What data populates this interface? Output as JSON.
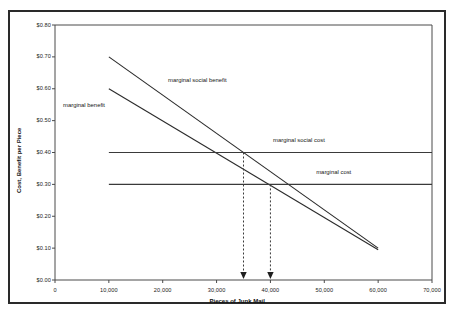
{
  "chart_data": {
    "type": "line",
    "title": "",
    "xlabel": "Pieces of Junk Mail",
    "ylabel": "Cost, Benefit per Piece",
    "xlim": [
      0,
      70000
    ],
    "ylim": [
      0.0,
      0.8
    ],
    "grid": false,
    "legend_position": "inline-labels",
    "x_ticks": [
      0,
      10000,
      20000,
      30000,
      40000,
      50000,
      60000,
      70000
    ],
    "x_tick_labels": [
      "0",
      "10,000",
      "20,000",
      "30,000",
      "40,000",
      "50,000",
      "60,000",
      "70,000"
    ],
    "y_ticks": [
      0.0,
      0.1,
      0.2,
      0.3,
      0.4,
      0.5,
      0.6,
      0.7,
      0.8
    ],
    "y_tick_labels": [
      "$0.00",
      "$0.10",
      "$0.20",
      "$0.30",
      "$0.40",
      "$0.50",
      "$0.60",
      "$0.70",
      "$0.80"
    ],
    "series": [
      {
        "name": "marginal social benefit",
        "label": "marginal social benefit",
        "type": "line",
        "x": [
          10000,
          60000
        ],
        "values": [
          0.7,
          0.1
        ],
        "label_x": 21000,
        "label_y": 0.625
      },
      {
        "name": "marginal benefit",
        "label": "marginal benefit",
        "type": "line",
        "x": [
          10000,
          60000
        ],
        "values": [
          0.6,
          0.095
        ],
        "label_x": 1500,
        "label_y": 0.545
      },
      {
        "name": "marginal social cost",
        "label": "marginal social cost",
        "type": "line",
        "x": [
          10000,
          70000
        ],
        "values": [
          0.4,
          0.4
        ],
        "label_x": 40500,
        "label_y": 0.435
      },
      {
        "name": "marginal cost",
        "label": "marginal cost",
        "type": "line",
        "x": [
          10000,
          70000
        ],
        "values": [
          0.3,
          0.3
        ],
        "label_x": 48500,
        "label_y": 0.335
      }
    ],
    "annotations": [
      {
        "name": "social-optimum-drop-arrow",
        "x": 35000,
        "y_from": 0.4,
        "y_to": 0.0,
        "style": "dashed-arrow-down"
      },
      {
        "name": "market-equilibrium-drop-arrow",
        "x": 40000,
        "y_from": 0.3,
        "y_to": 0.0,
        "style": "dashed-arrow-down"
      }
    ],
    "intersections": [
      {
        "name": "msb-msc",
        "x": 35000,
        "y": 0.4
      },
      {
        "name": "mb-mc",
        "x": 40000,
        "y": 0.3
      }
    ]
  },
  "colors": {
    "frame": "#2a2a2a",
    "axis": "#4a4a4a",
    "series": "#2b2b2b",
    "flat": "#3a3a3a",
    "text": "#1c1c1c",
    "background": "#ffffff"
  }
}
